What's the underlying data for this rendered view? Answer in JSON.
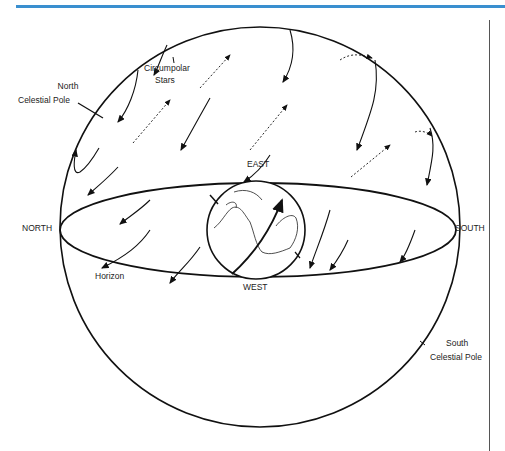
{
  "header": {
    "rule_color": "#3a8fcf"
  },
  "diagram": {
    "labels": {
      "north_pole_line1": "North",
      "north_pole_line2": "Celestial Pole",
      "circumpolar_line1": "Circumpolar",
      "circumpolar_line2": "Stars",
      "east": "EAST",
      "west": "WEST",
      "north": "NORTH",
      "south": "SOUTH",
      "horizon": "Horizon",
      "south_pole_line1": "South",
      "south_pole_line2": "Celestial Pole"
    },
    "stroke_color": "#111111"
  }
}
